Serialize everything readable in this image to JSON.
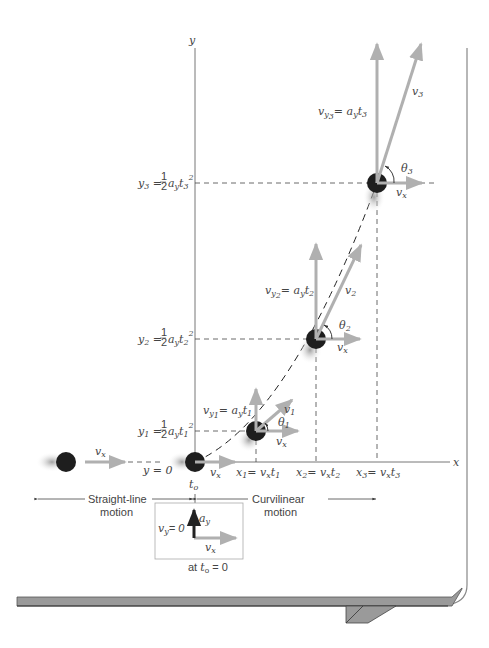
{
  "axes": {
    "x_label": "x",
    "y_label": "y"
  },
  "y_levels": [
    {
      "lhs": "y",
      "sub": "3",
      "eq": "= ",
      "half": "1/2",
      "rest": "a",
      "rest_sub": "y",
      "t": "t",
      "t_sub": "3",
      "pow": "2"
    },
    {
      "lhs": "y",
      "sub": "2",
      "eq": "= ",
      "half": "1/2",
      "rest": "a",
      "rest_sub": "y",
      "t": "t",
      "t_sub": "2",
      "pow": "2"
    },
    {
      "lhs": "y",
      "sub": "1",
      "eq": "= ",
      "half": "1/2",
      "rest": "a",
      "rest_sub": "y",
      "t": "t",
      "t_sub": "1",
      "pow": "2"
    },
    {
      "text": "y = 0"
    }
  ],
  "x_levels": [
    {
      "lhs": "x",
      "sub": "1",
      "rhs": "= v",
      "rhs_sub": "x",
      "t": "t",
      "t_sub": "1"
    },
    {
      "lhs": "x",
      "sub": "2",
      "rhs": "= v",
      "rhs_sub": "x",
      "t": "t",
      "t_sub": "2"
    },
    {
      "lhs": "x",
      "sub": "3",
      "rhs": "= v",
      "rhs_sub": "x",
      "t": "t",
      "t_sub": "3"
    }
  ],
  "vectors": {
    "vy3": {
      "v": "v",
      "y": "y",
      "n": "3",
      "rhs": "= a",
      "rhs_sub": "y",
      "t": "t",
      "t_sub": "3"
    },
    "vy2": {
      "v": "v",
      "y": "y",
      "n": "2",
      "rhs": "= a",
      "rhs_sub": "y",
      "t": "t",
      "t_sub": "2"
    },
    "vy1": {
      "v": "v",
      "y": "y",
      "n": "1",
      "rhs": "= a",
      "rhs_sub": "y",
      "t": "t",
      "t_sub": "1"
    },
    "v3": {
      "v": "v",
      "n": "3"
    },
    "v2": {
      "v": "v",
      "n": "2"
    },
    "v1": {
      "v": "v",
      "n": "1"
    },
    "theta3": {
      "t": "θ",
      "n": "3"
    },
    "theta2": {
      "t": "θ",
      "n": "2"
    },
    "theta1": {
      "t": "θ",
      "n": "1"
    },
    "vx": {
      "v": "v",
      "sub": "x"
    }
  },
  "t0_label": {
    "t": "t",
    "sub": "o"
  },
  "regions": {
    "straight_line_1": "Straight-line",
    "straight_line_2": "motion",
    "curvilinear_1": "Curvilinear",
    "curvilinear_2": "motion"
  },
  "inset": {
    "vy_text": "= 0",
    "vy_v": "v",
    "vy_sub": "y",
    "ay": "a",
    "ay_sub": "y",
    "vx": "v",
    "vx_sub": "x",
    "caption_at": "at ",
    "caption_t": "t",
    "caption_sub": "o",
    "caption_eq": " = 0"
  },
  "colors": {
    "vector_gray": "#b0b0b0",
    "axis": "#777777",
    "ball": "#1e1e1e",
    "ledge": "#9a9a9a"
  }
}
